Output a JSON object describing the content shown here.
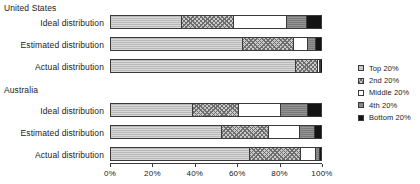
{
  "chart_data": {
    "type": "bar",
    "orientation": "horizontal",
    "stacked": true,
    "title": "",
    "xlabel": "",
    "ylabel": "",
    "xlim": [
      0,
      100
    ],
    "xticks": [
      "0%",
      "20%",
      "40%",
      "60%",
      "80%",
      "100%"
    ],
    "xtick_values": [
      0,
      20,
      40,
      60,
      80,
      100
    ],
    "grid": false,
    "legend_position": "right",
    "series": [
      {
        "name": "Top 20%",
        "key": "top",
        "pattern": "light-grey-solid"
      },
      {
        "name": "2nd 20%",
        "key": "second",
        "pattern": "cross-hatch"
      },
      {
        "name": "Middle 20%",
        "key": "middle",
        "pattern": "white-empty"
      },
      {
        "name": "4th 20%",
        "key": "fourth",
        "pattern": "dark-grey"
      },
      {
        "name": "Bottom 20%",
        "key": "bottom",
        "pattern": "black-solid"
      }
    ],
    "groups": [
      {
        "name": "United States",
        "rows": [
          {
            "label": "Ideal distribution",
            "values": [
              34.0,
              24.5,
              25.5,
              9.5,
              6.5
            ]
          },
          {
            "label": "Estimated distribution",
            "values": [
              63.0,
              24.0,
              7.0,
              3.5,
              2.5
            ]
          },
          {
            "label": "Actual distribution",
            "values": [
              88.0,
              10.5,
              1.0,
              0.4,
              0.1
            ]
          }
        ]
      },
      {
        "name": "Australia",
        "rows": [
          {
            "label": "Ideal distribution",
            "values": [
              39.0,
              22.0,
              20.0,
              13.0,
              6.0
            ]
          },
          {
            "label": "Estimated distribution",
            "values": [
              53.0,
              22.0,
              15.0,
              7.0,
              3.0
            ]
          },
          {
            "label": "Actual distribution",
            "values": [
              66.0,
              24.5,
              7.0,
              2.0,
              0.5
            ]
          }
        ]
      }
    ]
  },
  "legend": {
    "items": [
      {
        "label": "Top 20%"
      },
      {
        "label": "2nd 20%"
      },
      {
        "label": "Middle 20%"
      },
      {
        "label": "4th 20%"
      },
      {
        "label": "Bottom 20%"
      }
    ]
  },
  "colors": {
    "top": "#b9b9b9",
    "second": "#c9c9c9",
    "middle": "#ffffff",
    "fourth": "#7a7a7a",
    "bottom": "#141414",
    "outline": "#3a3a3a",
    "text": "#222222",
    "background": "#ffffff"
  }
}
